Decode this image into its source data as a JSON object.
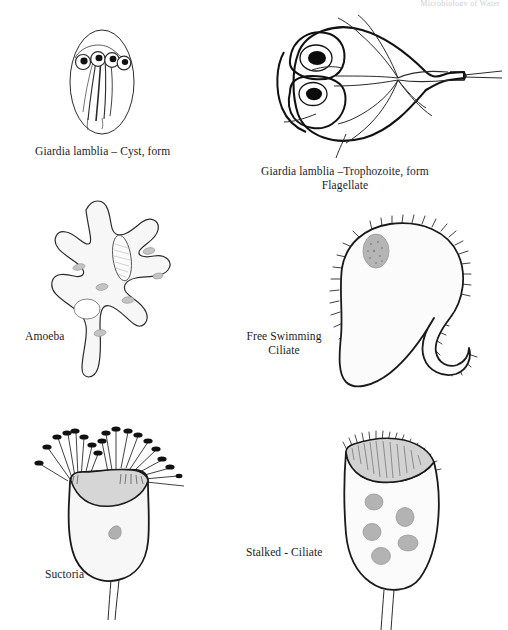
{
  "page": {
    "background_color": "#ffffff",
    "width": 508,
    "height": 630,
    "header_note": "Microbiology of Water"
  },
  "palette": {
    "ink": "#1a1a1a",
    "ink_soft": "#3a3a3a",
    "body_fill": "#fbfbfb",
    "cell_fill": "#f7f7f7",
    "granule_gray": "#b9b9b9",
    "nucleus_gray": "#a8a8a8",
    "disc_gray": "#d8d8d8",
    "streak_gray": "#bdbdbd",
    "caption_color": "#1c1c1c"
  },
  "figures": [
    {
      "id": "giardia-cyst",
      "name": "giardia-cyst-figure",
      "caption": "Giardia lamblia – Cyst, form",
      "caption_lines": [
        "Giardia lamblia – Cyst, form"
      ],
      "features": {
        "outline": "oval cyst wall",
        "nuclei_count": 4,
        "flagella_count": 4,
        "axostyle": "median bodies / axonemes",
        "gray_streak": true
      }
    },
    {
      "id": "giardia-trophozoite",
      "name": "giardia-trophozoite-figure",
      "caption": "Giardia lamblia –Trophozoite, form\nFlagellate",
      "caption_lines": [
        "Giardia lamblia –Trophozoite, form",
        "Flagellate"
      ],
      "features": {
        "outline": "pear / teardrop body with pointed tail",
        "nuclei_count": 2,
        "sucking_disc": true,
        "flagella_count": 8,
        "median_body": true
      }
    },
    {
      "id": "amoeba",
      "name": "amoeba-figure",
      "caption": "Amoeba",
      "caption_lines": [
        "Amoeba"
      ],
      "features": {
        "outline": "irregular body with pseudopodia",
        "pseudopod_count": 6,
        "nucleus": "elongated hatched oval",
        "contractile_vacuole": true,
        "granule_count": 6
      }
    },
    {
      "id": "free-swimming-ciliate",
      "name": "free-swimming-ciliate-figure",
      "caption": "Free Swimming\nCiliate",
      "caption_lines": [
        "Free Swimming",
        "Ciliate"
      ],
      "features": {
        "outline": "rounded body with hooked posterior lobe",
        "cilia": "fringe around entire perimeter",
        "nucleus_count": 1
      }
    },
    {
      "id": "suctoria",
      "name": "suctoria-figure",
      "caption": "Suctoria",
      "caption_lines": [
        "Suctoria"
      ],
      "features": {
        "outline": "goblet / vase shaped body",
        "tentacle_count": 18,
        "tentacle_tip": "knobbed black head",
        "gray_cap": true,
        "nucleus_count": 1,
        "stalk": true
      }
    },
    {
      "id": "stalked-ciliate",
      "name": "stalked-ciliate-figure",
      "caption": "Stalked - Ciliate",
      "caption_lines": [
        "Stalked - Ciliate"
      ],
      "features": {
        "outline": "bell shaped body",
        "peristome": "gray oral band with cilia fringe",
        "granule_count": 6,
        "stalk": true
      }
    }
  ]
}
